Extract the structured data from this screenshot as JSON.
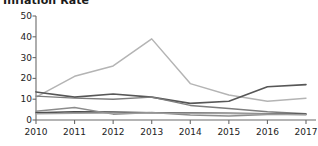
{
  "chart_data": {
    "type": "line",
    "title": "Inflation Rate",
    "subtitle": "",
    "xlabel": "",
    "ylabel": "",
    "x": [
      2010,
      2011,
      2012,
      2013,
      2014,
      2015,
      2016,
      2017
    ],
    "categories": [
      "2010",
      "2011",
      "2012",
      "2013",
      "2014",
      "2015",
      "2016",
      "2017"
    ],
    "xlim": [
      2010,
      2017
    ],
    "ylim": [
      0,
      50
    ],
    "yticks": [
      0,
      10,
      20,
      30,
      40,
      50
    ],
    "ytick_labels": [
      "0",
      "10",
      "20",
      "30",
      "40",
      "50"
    ],
    "xticks": [
      2010,
      2011,
      2012,
      2013,
      2014,
      2015,
      2016,
      2017
    ],
    "grid": false,
    "legend": false,
    "legend_position": "none",
    "axis_color": "#6b6b6b",
    "text_color": "#222222",
    "background": "#ffffff",
    "series": [
      {
        "name": "series-1",
        "color": "#b4b4b4",
        "width": 1.5,
        "values": [
          11.0,
          21.0,
          26.0,
          39.0,
          17.5,
          12.0,
          9.0,
          10.5
        ]
      },
      {
        "name": "series-2",
        "color": "#575757",
        "width": 1.6,
        "values": [
          13.5,
          11.0,
          12.5,
          11.0,
          8.0,
          9.0,
          16.0,
          17.0
        ]
      },
      {
        "name": "series-3",
        "color": "#7d7d7d",
        "width": 1.4,
        "values": [
          11.5,
          10.5,
          10.0,
          11.0,
          7.0,
          5.5,
          4.0,
          3.0
        ]
      },
      {
        "name": "series-4",
        "color": "#4a4a4a",
        "width": 1.5,
        "values": [
          3.5,
          4.0,
          3.8,
          3.5,
          3.4,
          3.2,
          3.0,
          2.8
        ]
      },
      {
        "name": "series-5",
        "color": "#8c8c8c",
        "width": 1.4,
        "values": [
          4.2,
          6.0,
          2.8,
          3.6,
          2.4,
          1.9,
          2.6,
          2.6
        ]
      },
      {
        "name": "series-6",
        "color": "#a0a0a0",
        "width": 1.3,
        "values": [
          3.0,
          3.2,
          3.3,
          3.3,
          3.2,
          3.1,
          2.9,
          2.5
        ]
      }
    ]
  }
}
